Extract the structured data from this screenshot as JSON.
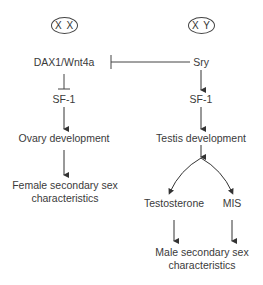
{
  "diagram": {
    "female_branch": {
      "chromosome": "X X",
      "gene": "DAX1/Wnt4a",
      "target": "SF-1",
      "development": "Ovary development",
      "outcome_line1": "Female secondary sex",
      "outcome_line2": "characteristics"
    },
    "male_branch": {
      "chromosome": "X Y",
      "gene": "Sry",
      "target": "SF-1",
      "development": "Testis development",
      "hormone_left": "Testosterone",
      "hormone_right": "MIS",
      "outcome_line1": "Male secondary sex",
      "outcome_line2": "characteristics"
    },
    "edges": [
      {
        "from": "Sry",
        "to": "DAX1/Wnt4a",
        "type": "inhibits"
      },
      {
        "from": "DAX1/Wnt4a",
        "to": "SF-1 (female)",
        "type": "inhibits"
      },
      {
        "from": "SF-1 (female)",
        "to": "Ovary development",
        "type": "activates"
      },
      {
        "from": "Ovary development",
        "to": "Female secondary sex characteristics",
        "type": "activates"
      },
      {
        "from": "Sry",
        "to": "SF-1 (male)",
        "type": "activates"
      },
      {
        "from": "SF-1 (male)",
        "to": "Testis development",
        "type": "activates"
      },
      {
        "from": "Testis development",
        "to": "Testosterone",
        "type": "activates"
      },
      {
        "from": "Testis development",
        "to": "MIS",
        "type": "activates"
      },
      {
        "from": "Testosterone",
        "to": "Male secondary sex characteristics",
        "type": "activates"
      },
      {
        "from": "MIS",
        "to": "Male secondary sex characteristics",
        "type": "activates"
      }
    ]
  }
}
